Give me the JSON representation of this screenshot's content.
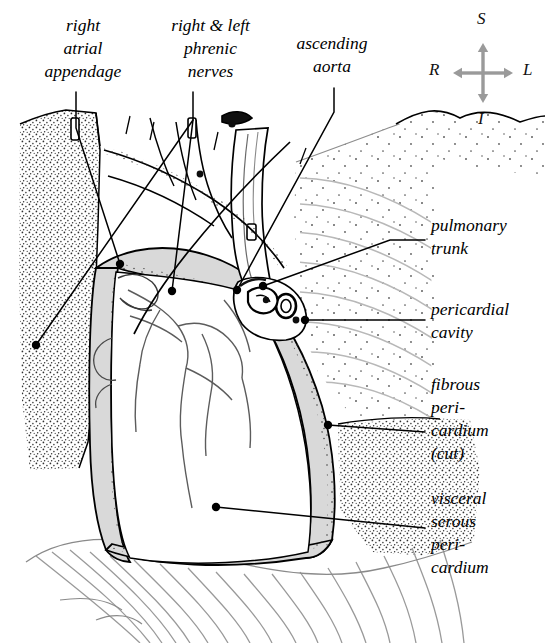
{
  "figure": {
    "kind": "anatomical-illustration",
    "background_color": "#ffffff",
    "ink_color": "#000000",
    "gray_fill": "#d9d9d9",
    "light_gray_fill": "#e8e8e8",
    "stipple_color": "#3a3a3a",
    "lung_line_color": "#b4b4b4"
  },
  "labels": [
    {
      "name": "right-atrial-appendage",
      "lines": [
        "right",
        "atrial",
        "appendage"
      ],
      "x": 18,
      "y": 14,
      "width": 130,
      "align": "center"
    },
    {
      "name": "right-and-left-phrenic-nerves",
      "lines": [
        "right & left",
        "phrenic",
        "nerves"
      ],
      "x": 148,
      "y": 14,
      "width": 125,
      "align": "center"
    },
    {
      "name": "ascending-aorta",
      "lines": [
        "ascending",
        "aorta"
      ],
      "x": 277,
      "y": 32,
      "width": 110,
      "align": "center"
    },
    {
      "name": "pulmonary-trunk",
      "lines": [
        "pulmonary",
        "trunk"
      ],
      "x": 431,
      "y": 214,
      "width": 112,
      "align": "left"
    },
    {
      "name": "pericardial-cavity",
      "lines": [
        "pericardial",
        "cavity"
      ],
      "x": 431,
      "y": 298,
      "width": 112,
      "align": "left"
    },
    {
      "name": "fibrous-pericardium-cut",
      "lines": [
        "fibrous",
        "peri-",
        "cardium",
        "(cut)"
      ],
      "x": 431,
      "y": 373,
      "width": 112,
      "align": "left"
    },
    {
      "name": "visceral-serous-pericardium",
      "lines": [
        "visceral",
        "serous",
        "peri-",
        "cardium"
      ],
      "x": 431,
      "y": 487,
      "width": 112,
      "align": "left"
    }
  ],
  "compass": {
    "name": "orientation-compass",
    "superior": "S",
    "inferior": "I",
    "right": "R",
    "left": "L",
    "arrow_color": "#9a9a9a",
    "center": {
      "x": 483,
      "y": 73
    }
  },
  "leaders": [
    {
      "name": "leader-right-atrial-appendage",
      "path": "M 76,92 L 76,128 L 120,264",
      "dot": {
        "x": 120,
        "y": 264
      }
    },
    {
      "name": "leader-phrenic-nerves",
      "path": "M 193,92 L 193,120 L 172,291",
      "dot": {
        "x": 172,
        "y": 291
      }
    },
    {
      "name": "leader-phrenic-nerves-secondary",
      "path": "M 193,120 L 36,345",
      "dot": {
        "x": 36,
        "y": 345
      }
    },
    {
      "name": "leader-ascending-aorta",
      "path": "M 334,88 L 334,112 L 237,290",
      "dot": {
        "x": 237,
        "y": 290
      }
    },
    {
      "name": "leader-pulmonary-trunk",
      "path": "M 425,240 L 390,240 L 263,286",
      "dot": {
        "x": 263,
        "y": 286
      }
    },
    {
      "name": "leader-pericardial-cavity",
      "path": "M 425,320 L 305,320",
      "dot": {
        "x": 305,
        "y": 320
      }
    },
    {
      "name": "leader-fibrous-pericardium",
      "path": "M 425,432 L 328,425",
      "dot": {
        "x": 328,
        "y": 425
      }
    },
    {
      "name": "leader-visceral-serous-pericardium",
      "path": "M 425,528 L 216,507",
      "dot": {
        "x": 216,
        "y": 507
      }
    }
  ]
}
